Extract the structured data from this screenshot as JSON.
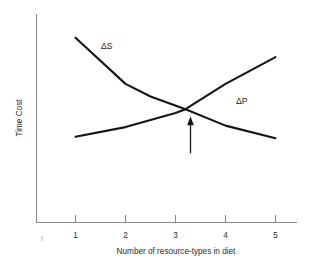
{
  "chart_data": {
    "type": "line",
    "title": "",
    "subtitle": "",
    "xlabel": "Number of resource-types in diet",
    "ylabel": "Time Cost",
    "xlim": [
      0.6,
      5.6
    ],
    "ylim": [
      0,
      1
    ],
    "x_ticks": [
      1,
      2,
      3,
      4,
      5
    ],
    "x_tick_labels": [
      "1",
      "2",
      "3",
      "4",
      "5"
    ],
    "y_ticks": [],
    "y_tick_labels": [],
    "grid": false,
    "legend": "inline-curve-labels",
    "series": [
      {
        "name": "ΔS",
        "label": "ΔS",
        "description": "search time cost, decreasing with diet breadth",
        "color": "#141414",
        "x": [
          1.0,
          2.0,
          2.5,
          3.2,
          4.0,
          5.0
        ],
        "y": [
          0.955,
          0.645,
          0.56,
          0.475,
          0.365,
          0.28
        ]
      },
      {
        "name": "ΔP",
        "label": "ΔP",
        "description": "pursuit and handling cost, increasing with diet breadth",
        "color": "#141414",
        "x": [
          1.0,
          2.0,
          3.0,
          3.2,
          4.0,
          5.0
        ],
        "y": [
          0.29,
          0.355,
          0.45,
          0.475,
          0.645,
          0.825
        ]
      }
    ],
    "annotations": [
      {
        "name": "optimum-arrow",
        "type": "arrow",
        "points_to_x": 3.22,
        "points_to_y": 0.475,
        "label": "",
        "description": "arrow marking optimal diet breadth at curve intersection"
      }
    ],
    "intersection": {
      "x": 3.22,
      "y": 0.475
    }
  },
  "labels": {
    "x_axis_title": "Number of resource-types in diet",
    "y_axis_title": "Time Cost",
    "delta_s": "ΔS",
    "delta_p": "ΔP",
    "tick_1": "1",
    "tick_2": "2",
    "tick_3": "3",
    "tick_4": "4",
    "tick_5": "5"
  },
  "colors": {
    "curve": "#141414",
    "axis": "#8a8a8a",
    "text": "#2b2b2b",
    "background": "#ffffff"
  }
}
